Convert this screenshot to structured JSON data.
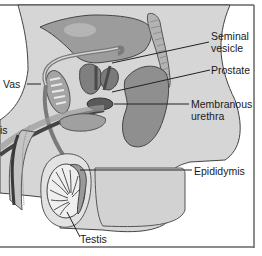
{
  "figure": {
    "type": "anatomical-diagram",
    "colors": {
      "background": "#ffffff",
      "body_fill": "#d9d9d9",
      "organ_mid": "#9a9a9a",
      "organ_dark": "#555555",
      "outline": "#3a3a3a",
      "leader_line": "#222222",
      "frame": "#555555"
    }
  },
  "labels": {
    "seminal_vesicle_line1": "Seminal",
    "seminal_vesicle_line2": "vesicle",
    "prostate": "Prostate",
    "membranous_urethra_line1": "Membranous",
    "membranous_urethra_line2": "urethra",
    "vas": "Vas",
    "epididymis": "Epididymis",
    "testis": "Testis",
    "left_cut": "is"
  }
}
